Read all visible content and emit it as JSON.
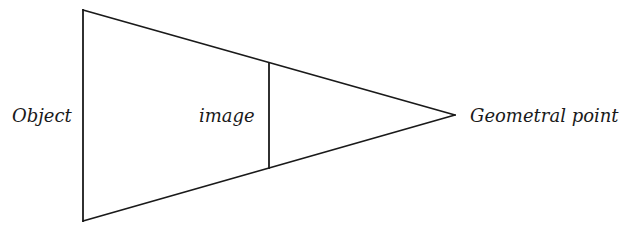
{
  "diagram": {
    "type": "perspective-projection",
    "labels": {
      "object": "Object",
      "image": "image",
      "geometral_point": "Geometral point"
    },
    "colors": {
      "line": "#1a1a1a",
      "text": "#1a1a1a",
      "background": "#ffffff"
    },
    "geometry": {
      "object_line": {
        "x": 83,
        "y1": 10,
        "y2": 221
      },
      "image_line": {
        "x": 269,
        "y1": 63,
        "y2": 168
      },
      "apex": {
        "x": 455,
        "y": 115
      }
    }
  }
}
